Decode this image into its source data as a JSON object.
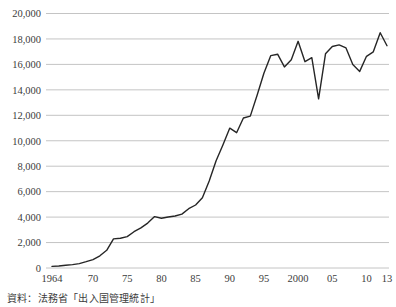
{
  "chart_data": {
    "type": "line",
    "title": "",
    "xlabel": "",
    "ylabel": "",
    "xlim": [
      1964,
      2013
    ],
    "ylim": [
      0,
      20000
    ],
    "grid": "horizontal",
    "legend": "none",
    "x": [
      1964,
      1965,
      1966,
      1967,
      1968,
      1969,
      1970,
      1971,
      1972,
      1973,
      1974,
      1975,
      1976,
      1977,
      1978,
      1979,
      1980,
      1981,
      1982,
      1983,
      1984,
      1985,
      1986,
      1987,
      1988,
      1989,
      1990,
      1991,
      1992,
      1993,
      1994,
      1995,
      1996,
      1997,
      1998,
      1999,
      2000,
      2001,
      2002,
      2003,
      2004,
      2005,
      2006,
      2007,
      2008,
      2009,
      2010,
      2011,
      2012,
      2013
    ],
    "values": [
      128,
      159,
      212,
      268,
      344,
      493,
      663,
      961,
      1392,
      2289,
      2336,
      2466,
      2852,
      3151,
      3525,
      4038,
      3909,
      4006,
      4086,
      4232,
      4659,
      4948,
      5516,
      6829,
      8427,
      9663,
      10997,
      10634,
      11791,
      11934,
      13579,
      15298,
      16695,
      16803,
      15806,
      16358,
      17819,
      16216,
      16523,
      13296,
      16831,
      17404,
      17535,
      17295,
      15987,
      15446,
      16637,
      16994,
      18491,
      17473
    ],
    "y_ticks": [
      {
        "value": 0,
        "label": "0"
      },
      {
        "value": 2000,
        "label": "2,000"
      },
      {
        "value": 4000,
        "label": "4,000"
      },
      {
        "value": 6000,
        "label": "6,000"
      },
      {
        "value": 8000,
        "label": "8,000"
      },
      {
        "value": 10000,
        "label": "10,000"
      },
      {
        "value": 12000,
        "label": "12,000"
      },
      {
        "value": 14000,
        "label": "14,000"
      },
      {
        "value": 16000,
        "label": "16,000"
      },
      {
        "value": 18000,
        "label": "18,000"
      },
      {
        "value": 20000,
        "label": "20,000"
      }
    ],
    "x_ticks": [
      {
        "year": 1964,
        "label": "1964"
      },
      {
        "year": 1970,
        "label": "70"
      },
      {
        "year": 1975,
        "label": "75"
      },
      {
        "year": 1980,
        "label": "80"
      },
      {
        "year": 1985,
        "label": "85"
      },
      {
        "year": 1990,
        "label": "90"
      },
      {
        "year": 1995,
        "label": "95"
      },
      {
        "year": 2000,
        "label": "2000"
      },
      {
        "year": 2005,
        "label": "05"
      },
      {
        "year": 2010,
        "label": "10"
      },
      {
        "year": 2013,
        "label": "13"
      }
    ],
    "line_color": "#262626",
    "grid_color": "#c4c4c4",
    "text_color": "#3c3c3c"
  },
  "source_note": "資料：法務省「出入国管理統計」"
}
